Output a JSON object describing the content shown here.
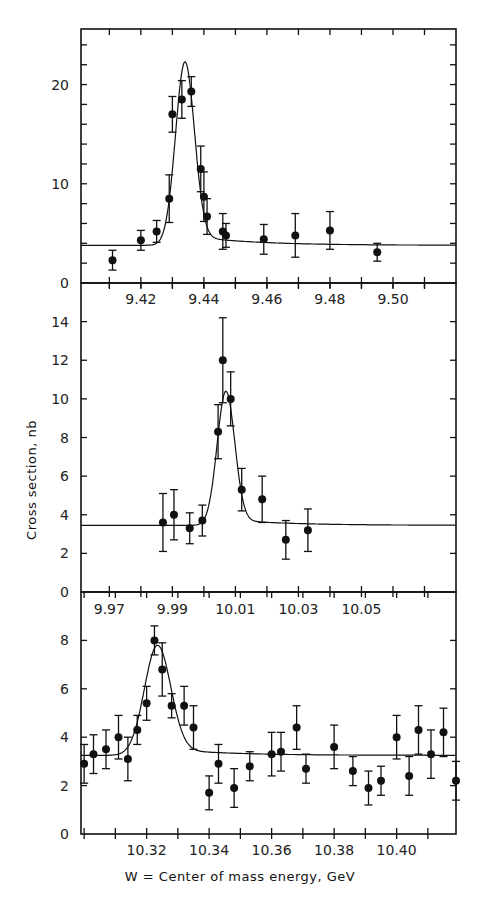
{
  "figure": {
    "ylabel": "Cross section, nb",
    "xlabel": "W = Center of mass energy, GeV"
  },
  "chart_data": [
    {
      "type": "scatter",
      "title": "",
      "xlabel": "W = Center of mass energy, GeV",
      "ylabel": "Cross section, nb",
      "xlim": [
        9.401,
        9.52
      ],
      "ylim": [
        0,
        25.6
      ],
      "xticks": [
        9.42,
        9.44,
        9.46,
        9.48,
        9.5
      ],
      "xtick_labels": [
        "9.42",
        "9.44",
        "9.46",
        "9.48",
        "9.50"
      ],
      "yticks": [
        0,
        10,
        20
      ],
      "ytick_labels": [
        "0",
        "10",
        "20"
      ],
      "grid": false,
      "series": [
        {
          "name": "data",
          "x": [
            9.411,
            9.42,
            9.425,
            9.429,
            9.43,
            9.433,
            9.436,
            9.439,
            9.44,
            9.441,
            9.446,
            9.447,
            9.459,
            9.469,
            9.48,
            9.495
          ],
          "y": [
            2.3,
            4.3,
            5.2,
            8.5,
            17.0,
            18.5,
            19.3,
            11.5,
            8.7,
            6.7,
            5.2,
            4.8,
            4.4,
            4.8,
            5.3,
            3.1
          ],
          "yerr": [
            1.0,
            1.0,
            1.1,
            2.4,
            1.8,
            1.9,
            1.5,
            2.3,
            2.5,
            1.8,
            1.8,
            1.2,
            1.5,
            2.2,
            1.9,
            0.9
          ]
        },
        {
          "name": "fit",
          "type": "line",
          "peak_x": 9.434,
          "peak_y": 22.3,
          "baseline": 3.8,
          "sigma": 0.003
        }
      ]
    },
    {
      "type": "scatter",
      "title": "",
      "xlabel": "",
      "ylabel": "Cross section, nb",
      "xlim": [
        9.961,
        10.08
      ],
      "ylim": [
        0,
        16
      ],
      "xticks": [
        9.97,
        9.99,
        10.01,
        10.03,
        10.05
      ],
      "xtick_labels": [
        "9.97",
        "9.99",
        "10.01",
        "10.03",
        "10.05"
      ],
      "yticks": [
        0,
        2,
        4,
        6,
        8,
        10,
        12,
        14
      ],
      "ytick_labels": [
        "0",
        "2",
        "4",
        "6",
        "8",
        "10",
        "12",
        "14"
      ],
      "grid": false,
      "series": [
        {
          "name": "data",
          "x": [
            9.987,
            9.9905,
            9.9955,
            9.9995,
            10.0045,
            10.006,
            10.0085,
            10.012,
            10.0185,
            10.026,
            10.033
          ],
          "y": [
            3.6,
            4.0,
            3.3,
            3.7,
            8.3,
            12.0,
            10.0,
            5.3,
            4.8,
            2.7,
            3.2
          ],
          "yerr": [
            1.5,
            1.3,
            0.8,
            0.8,
            1.4,
            2.2,
            1.4,
            1.1,
            1.2,
            1.0,
            1.1
          ]
        },
        {
          "name": "fit",
          "type": "line",
          "peak_x": 10.007,
          "peak_y": 10.4,
          "baseline": 3.45,
          "sigma": 0.0028
        }
      ]
    },
    {
      "type": "scatter",
      "title": "",
      "xlabel": "W = Center of mass energy, GeV",
      "ylabel": "Cross section, nb",
      "xlim": [
        10.299,
        10.419
      ],
      "ylim": [
        0,
        10
      ],
      "xticks": [
        10.32,
        10.34,
        10.36,
        10.38,
        10.4
      ],
      "xtick_labels": [
        "10.32",
        "10.34",
        "10.36",
        "10.38",
        "10.40"
      ],
      "yticks": [
        0,
        2,
        4,
        6,
        8
      ],
      "ytick_labels": [
        "0",
        "2",
        "4",
        "6",
        "8"
      ],
      "grid": false,
      "series": [
        {
          "name": "data",
          "x": [
            10.3,
            10.303,
            10.307,
            10.311,
            10.314,
            10.317,
            10.32,
            10.3225,
            10.325,
            10.328,
            10.332,
            10.335,
            10.34,
            10.343,
            10.348,
            10.353,
            10.36,
            10.363,
            10.368,
            10.371,
            10.38,
            10.386,
            10.391,
            10.395,
            10.4,
            10.404,
            10.407,
            10.411,
            10.415,
            10.419
          ],
          "y": [
            2.9,
            3.3,
            3.5,
            4.0,
            3.1,
            4.3,
            5.4,
            8.0,
            6.8,
            5.3,
            5.3,
            4.4,
            1.7,
            2.9,
            1.9,
            2.8,
            3.3,
            3.4,
            4.4,
            2.7,
            3.6,
            2.6,
            1.9,
            2.2,
            4.0,
            2.4,
            4.3,
            3.3,
            4.2,
            2.2
          ],
          "yerr": [
            0.8,
            0.8,
            0.8,
            0.9,
            0.9,
            0.6,
            0.7,
            0.6,
            1.1,
            0.5,
            0.8,
            0.9,
            0.7,
            0.8,
            0.8,
            0.6,
            0.9,
            0.8,
            0.9,
            0.6,
            0.9,
            0.6,
            0.7,
            0.6,
            0.9,
            0.8,
            1.0,
            1.0,
            1.0,
            0.8
          ]
        },
        {
          "name": "fit",
          "type": "line",
          "peak_x": 10.3235,
          "peak_y": 7.8,
          "baseline": 3.25,
          "sigma": 0.0042
        }
      ]
    }
  ]
}
